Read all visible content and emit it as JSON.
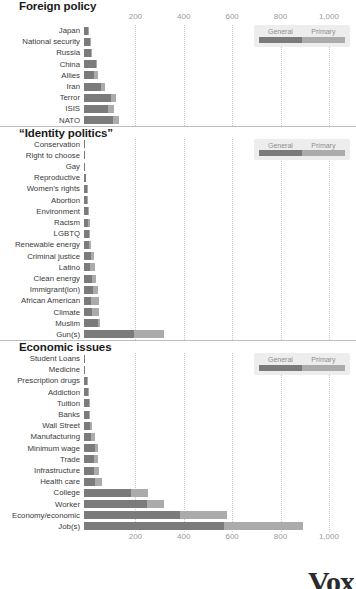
{
  "axis": {
    "ticks": [
      200,
      400,
      600,
      800,
      1000
    ],
    "tick_labels": [
      "200",
      "400",
      "600",
      "800",
      "1,000"
    ],
    "xmin": 0,
    "xmax": 1050
  },
  "legend": {
    "general_label": "General",
    "primary_label": "Primary",
    "general_color": "#7b7b7b",
    "primary_color": "#ababab"
  },
  "source": {
    "logo": "Vox"
  },
  "chart_data": {
    "type": "bar",
    "orientation": "horizontal",
    "stacked": true,
    "xlabel": "",
    "ylabel": "",
    "xlim": [
      0,
      1050
    ],
    "grid": true,
    "legend_position": "top-right",
    "series": [
      {
        "name": "General",
        "color": "#7b7b7b"
      },
      {
        "name": "Primary",
        "color": "#ababab"
      }
    ],
    "panels": [
      {
        "title": "Foreign policy",
        "categories": [
          "Japan",
          "National security",
          "Russia",
          "China",
          "Allies",
          "Iran",
          "Terror",
          "ISIS",
          "NATO"
        ],
        "general": [
          18,
          26,
          28,
          50,
          40,
          72,
          110,
          100,
          118
        ],
        "primary": [
          2,
          4,
          7,
          5,
          18,
          16,
          22,
          25,
          27
        ],
        "totals": [
          20,
          30,
          35,
          55,
          58,
          88,
          132,
          125,
          145
        ]
      },
      {
        "title": "“Identity politics”",
        "categories": [
          "Conservation",
          "Right to choose",
          "Gay",
          "Reproductive",
          "Women's rights",
          "Abortion",
          "Environment",
          "Racism",
          "LGBTQ",
          "Renewable energy",
          "Criminal justice",
          "Latino",
          "Clean energy",
          "Immigrant(ion)",
          "African American",
          "Climate",
          "Muslim",
          "Gun(s)"
        ],
        "general": [
          4,
          5,
          6,
          8,
          12,
          14,
          15,
          18,
          20,
          22,
          28,
          24,
          34,
          38,
          30,
          32,
          58,
          205
        ],
        "primary": [
          0,
          0,
          0,
          0,
          1,
          1,
          2,
          5,
          4,
          8,
          12,
          20,
          14,
          18,
          32,
          32,
          10,
          125
        ],
        "totals": [
          4,
          5,
          6,
          8,
          13,
          15,
          17,
          23,
          24,
          30,
          40,
          44,
          48,
          56,
          62,
          64,
          68,
          330
        ]
      },
      {
        "title": "Economic issues",
        "categories": [
          "Student Loans",
          "Medicine",
          "Prescription drugs",
          "Addiction",
          "Tuition",
          "Banks",
          "Wall Street",
          "Manufacturing",
          "Minimum wage",
          "Trade",
          "Infrastructure",
          "Health care",
          "College",
          "Worker",
          "Economy/economic",
          "Job(s)"
        ],
        "general": [
          5,
          6,
          14,
          16,
          22,
          22,
          26,
          30,
          44,
          40,
          42,
          46,
          195,
          260,
          395,
          580
        ],
        "primary": [
          0,
          0,
          1,
          2,
          2,
          2,
          8,
          14,
          14,
          18,
          22,
          28,
          70,
          70,
          195,
          325
        ],
        "totals": [
          5,
          6,
          15,
          18,
          24,
          24,
          34,
          44,
          58,
          58,
          64,
          74,
          265,
          330,
          590,
          905
        ]
      }
    ]
  }
}
